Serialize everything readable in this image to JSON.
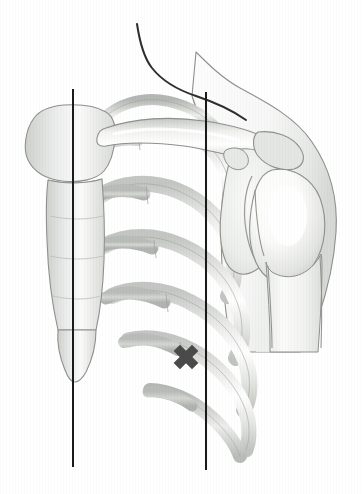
{
  "figure": {
    "title": "Anterior chest wall landmark diagram",
    "subject": "Right anterolateral thorax with shoulder girdle",
    "view": "anterior oblique",
    "width": 363,
    "height": 494,
    "background_color": "#ffffff"
  },
  "palette": {
    "background": "#ffffff",
    "bone_fill_light": "#f4f4f3",
    "bone_fill_mid": "#e2e3e1",
    "bone_fill_dark": "#c9cbc8",
    "cartilage_fill": "#d8dad6",
    "shadow_gray": "#b9bcb8",
    "soft_tissue": "#f7f7f6",
    "outline": "#8e918c",
    "outline_strong": "#3a3a3a",
    "marker_color": "#4a4a4a",
    "reference_line_color": "#1a1a1a",
    "highlight_white": "#ffffff"
  },
  "reference_lines": [
    {
      "name": "midsternal-line",
      "label": "Midsternal / parasternal reference line",
      "x": 73,
      "y_top": 89,
      "y_bottom": 467,
      "stroke_width": 2.0,
      "color": "#1a1a1a"
    },
    {
      "name": "midclavicular-line",
      "label": "Midclavicular reference line",
      "x": 206,
      "y_top": 92,
      "y_bottom": 470,
      "stroke_width": 2.0,
      "color": "#1a1a1a"
    }
  ],
  "marker": {
    "name": "landmark-x-marker",
    "label": "X",
    "description": "Target landmark in the intercostal space",
    "center_x": 186,
    "center_y": 357,
    "arm_length": 13,
    "thickness": 9,
    "rotation_deg": 45,
    "color": "#4a4a4a"
  },
  "structures": [
    {
      "name": "neck-contour",
      "label": "Neck contour"
    },
    {
      "name": "shoulder-contour",
      "label": "Shoulder and upper arm soft-tissue contour"
    },
    {
      "name": "clavicle",
      "label": "Clavicle"
    },
    {
      "name": "acromion",
      "label": "Acromion"
    },
    {
      "name": "coracoid-process",
      "label": "Coracoid process"
    },
    {
      "name": "scapula-glenoid",
      "label": "Scapula and glenoid fossa"
    },
    {
      "name": "humeral-head",
      "label": "Humeral head"
    },
    {
      "name": "humerus-shaft",
      "label": "Humeral shaft"
    },
    {
      "name": "manubrium",
      "label": "Manubrium of sternum"
    },
    {
      "name": "sternal-body",
      "label": "Body of sternum"
    },
    {
      "name": "xiphoid-process",
      "label": "Xiphoid process"
    },
    {
      "name": "rib-1",
      "label": "First rib"
    },
    {
      "name": "rib-2",
      "label": "Second rib"
    },
    {
      "name": "rib-3",
      "label": "Third rib"
    },
    {
      "name": "rib-4",
      "label": "Fourth rib"
    },
    {
      "name": "rib-5",
      "label": "Fifth rib"
    },
    {
      "name": "rib-6",
      "label": "Sixth rib"
    },
    {
      "name": "rib-7",
      "label": "Seventh rib"
    },
    {
      "name": "costal-cartilages",
      "label": "Costal cartilages"
    }
  ],
  "annotations": {
    "visible_text": [],
    "note": "The illustration carries no printed labels; the only graphic annotations are two vertical reference lines and one X landmark marker."
  }
}
